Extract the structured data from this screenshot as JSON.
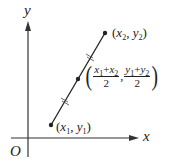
{
  "diagram": {
    "type": "coordinate-midpoint",
    "axes": {
      "x_label": "x",
      "y_label": "y",
      "origin_label": "O"
    },
    "points": {
      "p1": {
        "label_open": "(",
        "var_x": "x",
        "sub_x": "1",
        "sep": ", ",
        "var_y": "y",
        "sub_y": "1",
        "label_close": ")"
      },
      "p2": {
        "label_open": "(",
        "var_x": "x",
        "sub_x": "2",
        "sep": ", ",
        "var_y": "y",
        "sub_y": "2",
        "label_close": ")"
      },
      "midpoint": {
        "open": "(",
        "close": ")",
        "comma": ",",
        "x_num": {
          "a": "x",
          "a_sub": "1",
          "plus": "+",
          "b": "x",
          "b_sub": "2"
        },
        "x_den": "2",
        "y_num": {
          "a": "y",
          "a_sub": "1",
          "plus": "+",
          "b": "y",
          "b_sub": "2"
        },
        "y_den": "2"
      }
    },
    "colors": {
      "line": "#222222",
      "background": "#ffffff"
    }
  }
}
